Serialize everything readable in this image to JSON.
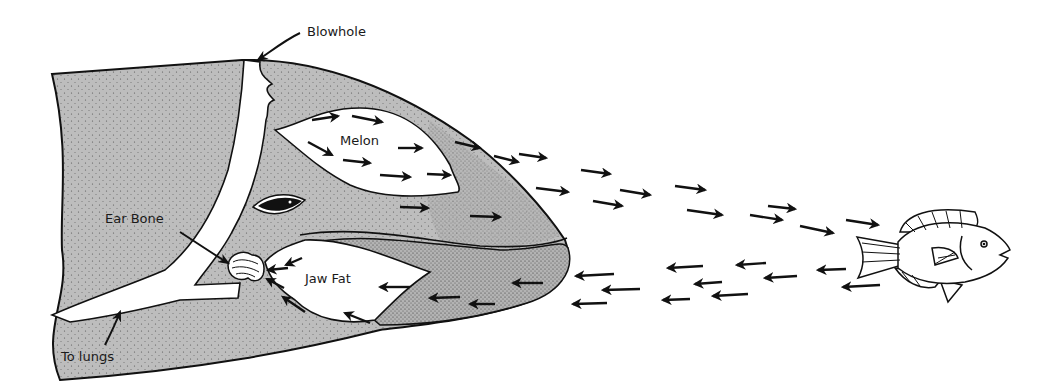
{
  "diagram": {
    "labels": {
      "blowhole": "Blowhole",
      "melon": "Melon",
      "ear_bone": "Ear Bone",
      "jaw_fat": "Jaw Fat",
      "to_lungs": "To lungs"
    },
    "colors": {
      "tissue_fill": "#bdbdbd",
      "outline": "#111111",
      "air_passage": "#ffffff",
      "arrow": "#111111"
    },
    "outgoing_arrow_count": 22,
    "incoming_arrow_count": 20
  }
}
